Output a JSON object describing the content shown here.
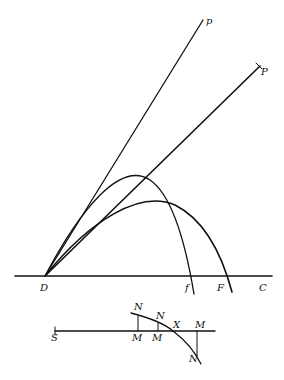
{
  "upper_figure": {
    "labels": {
      "p": "p",
      "P": "P",
      "D": "D",
      "f": "f",
      "F": "F",
      "C": "C"
    }
  },
  "lower_figure": {
    "labels": {
      "S": "S",
      "N1": "N",
      "N2": "N",
      "N3": "N",
      "X": "X",
      "M1": "M",
      "M2": "M",
      "M3": "M"
    }
  },
  "colors": {
    "ink": "#111111",
    "paper": "#ffffff"
  }
}
